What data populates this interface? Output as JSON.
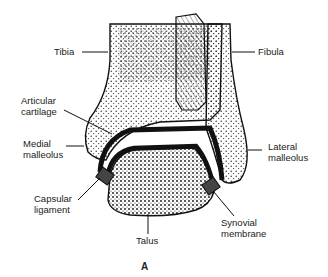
{
  "figure": {
    "caption": "A",
    "labels": {
      "tibia": "Tibia",
      "fibula": "Fibula",
      "articular_cartilage_1": "Articular",
      "articular_cartilage_2": "cartilage",
      "medial_malleolus_1": "Medial",
      "medial_malleolus_2": "malleolus",
      "lateral_malleolus_1": "Lateral",
      "lateral_malleolus_2": "malleolus",
      "capsular_ligament_1": "Capsular",
      "capsular_ligament_2": "ligament",
      "synovial_membrane_1": "Synovial",
      "synovial_membrane_2": "membrane",
      "talus": "Talus"
    }
  }
}
